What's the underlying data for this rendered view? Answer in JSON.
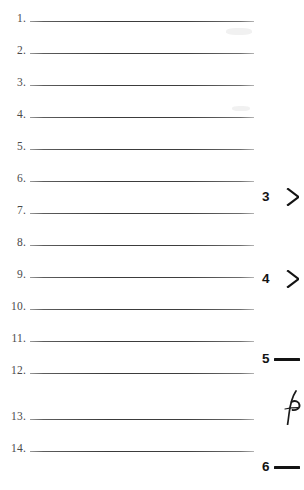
{
  "page": {
    "type": "scanned-worksheet",
    "background_color": "#ffffff",
    "rule_color": "#3a3a3a",
    "number_color": "#4a4a4a",
    "marker_color": "#131313"
  },
  "numbered_lines": [
    {
      "number": "1.",
      "value": "",
      "top": 6
    },
    {
      "number": "2.",
      "value": "",
      "top": 38
    },
    {
      "number": "3.",
      "value": "",
      "top": 70
    },
    {
      "number": "4.",
      "value": "",
      "top": 102
    },
    {
      "number": "5.",
      "value": "",
      "top": 134
    },
    {
      "number": "6.",
      "value": "",
      "top": 166
    },
    {
      "number": "7.",
      "value": "",
      "top": 198
    },
    {
      "number": "8.",
      "value": "",
      "top": 230
    },
    {
      "number": "9.",
      "value": "",
      "top": 262
    },
    {
      "number": "10.",
      "value": "",
      "top": 294
    },
    {
      "number": "11.",
      "value": "",
      "top": 326
    },
    {
      "number": "12.",
      "value": "",
      "top": 358
    },
    {
      "number": "13.",
      "value": "",
      "top": 404
    },
    {
      "number": "14.",
      "value": "",
      "top": 436
    }
  ],
  "margin_markers": [
    {
      "label": "3",
      "glyph": "chevron",
      "top": 187
    },
    {
      "label": "4",
      "glyph": "chevron",
      "top": 269
    },
    {
      "label": "5",
      "glyph": "dash",
      "top": 349
    },
    {
      "label": "6",
      "glyph": "dash",
      "top": 457
    }
  ],
  "handwriting": {
    "description": "partial cursive letter clipped at right page edge"
  }
}
